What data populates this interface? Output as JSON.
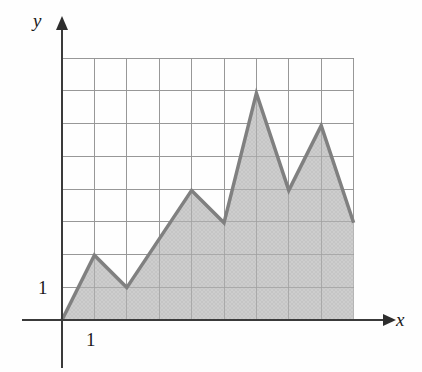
{
  "figure": {
    "name": "area-under-piecewise-linear-graph",
    "background_color": "#fefefe"
  },
  "axes": {
    "x_axis_label": "x",
    "y_axis_label": "y",
    "x_tick_label": "1",
    "y_tick_label": "1",
    "axis_color": "#3a3a3a",
    "arrow_style": "solid-triangle"
  },
  "grid": {
    "visible": true,
    "columns": 9,
    "rows": 8,
    "cell_size_px": 32.4,
    "line_color": "#8d8d8d",
    "origin_px": {
      "x": 62,
      "y": 320
    }
  },
  "chart_data": {
    "type": "area",
    "title": "",
    "xlabel": "x",
    "ylabel": "y",
    "xlim": [
      0,
      9
    ],
    "ylim": [
      0,
      8
    ],
    "grid": true,
    "legend": "none",
    "x_ticks": [
      1
    ],
    "y_ticks": [
      1
    ],
    "series": [
      {
        "name": "piecewise-linear-function",
        "x": [
          0,
          1,
          2,
          4,
          5,
          6,
          7,
          8,
          9
        ],
        "values": [
          0,
          2,
          1,
          4,
          3,
          7,
          4,
          6,
          3
        ],
        "line_color": "#808080",
        "line_width_px": 3.5,
        "fill": true,
        "fill_color": "#cbcbcb",
        "fill_to": 0
      }
    ],
    "annotations": []
  }
}
